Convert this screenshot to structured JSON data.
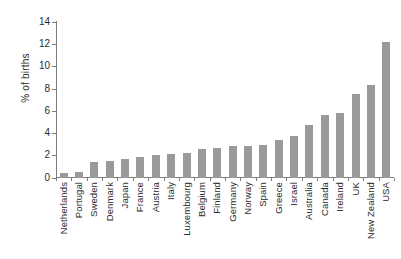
{
  "chart_data": {
    "type": "bar",
    "title": "",
    "xlabel": "",
    "ylabel": "% of births",
    "ylim": [
      0,
      14
    ],
    "ytick_values": [
      14,
      12,
      10,
      8,
      6,
      4,
      2,
      0
    ],
    "ytick_labels": [
      "14",
      "12",
      "10",
      "8",
      "6",
      "4",
      "2",
      "0"
    ],
    "grid": false,
    "legend": false,
    "bar_color": "#9a9a9a",
    "axis_color": "#7d7d7d",
    "categories": [
      "Netherlands",
      "Portugal",
      "Sweden",
      "Denmark",
      "Japan",
      "France",
      "Austria",
      "Italy",
      "Luxembourg",
      "Belgium",
      "Finland",
      "Germany",
      "Norway",
      "Spain",
      "Greece",
      "Israel",
      "Australia",
      "Canada",
      "Ireland",
      "UK",
      "New Zealand",
      "USA"
    ],
    "values": [
      0.45,
      0.5,
      1.4,
      1.55,
      1.75,
      1.85,
      2.1,
      2.15,
      2.25,
      2.6,
      2.7,
      2.85,
      2.85,
      3.0,
      3.45,
      3.75,
      4.75,
      5.7,
      5.85,
      7.6,
      8.4,
      12.25
    ]
  }
}
